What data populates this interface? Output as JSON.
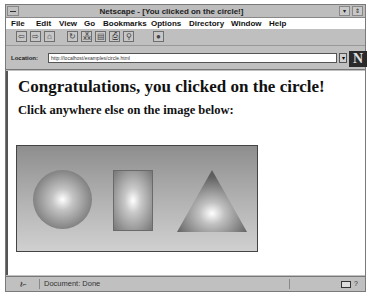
{
  "window": {
    "title": "Netscape - [You clicked on the circle!]",
    "controls": [
      "minimize",
      "restore"
    ]
  },
  "menubar": {
    "items": [
      {
        "label": "File",
        "accel": "F"
      },
      {
        "label": "Edit",
        "accel": "E"
      },
      {
        "label": "View",
        "accel": "V"
      },
      {
        "label": "Go",
        "accel": "G"
      },
      {
        "label": "Bookmarks",
        "accel": "B"
      },
      {
        "label": "Options",
        "accel": "O"
      },
      {
        "label": "Directory",
        "accel": "D"
      },
      {
        "label": "Window",
        "accel": "W"
      },
      {
        "label": "Help",
        "accel": "H"
      }
    ]
  },
  "toolbar": {
    "buttons": [
      {
        "name": "back",
        "glyph": "⇦"
      },
      {
        "name": "forward",
        "glyph": "⇨"
      },
      {
        "name": "home",
        "glyph": "⌂"
      },
      {
        "name": "reload",
        "glyph": "↻"
      },
      {
        "name": "images",
        "glyph": "⁂"
      },
      {
        "name": "open",
        "glyph": "▤"
      },
      {
        "name": "print",
        "glyph": "⎙"
      },
      {
        "name": "find",
        "glyph": "⚲"
      },
      {
        "name": "stop",
        "glyph": "●"
      }
    ]
  },
  "location": {
    "label": "Location:",
    "url": "http://localhost/examples/circle.html",
    "dropdown_glyph": "▾",
    "logo": "N"
  },
  "page": {
    "heading": "Congratulations, you clicked on the circle!",
    "subheading": "Click anywhere else on the image below:",
    "imagemap": {
      "shapes": [
        "circle",
        "rectangle",
        "triangle"
      ]
    }
  },
  "statusbar": {
    "security_glyph": "⚷⌐",
    "text": "Document: Done",
    "mail_glyph": "?"
  },
  "colors": {
    "window_gray": "#c0c0c0",
    "content_bg": "#ffffff",
    "logo_bg": "#2a2a2a"
  }
}
